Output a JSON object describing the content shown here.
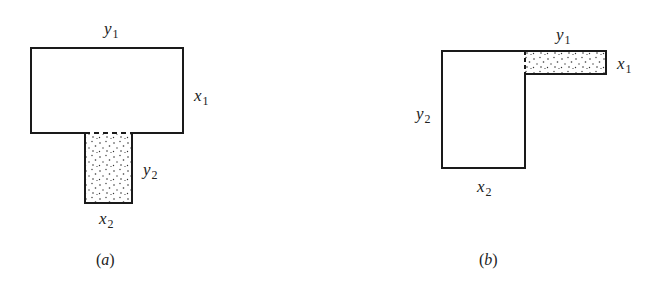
{
  "figure": {
    "panels": [
      {
        "id": "a",
        "caption_open": "(",
        "caption_letter": "a",
        "caption_close": ")",
        "shape": "T-section",
        "labels": {
          "y1": {
            "var": "y",
            "sub": "1"
          },
          "x1": {
            "var": "x",
            "sub": "1"
          },
          "y2": {
            "var": "y",
            "sub": "2"
          },
          "x2": {
            "var": "x",
            "sub": "2"
          }
        },
        "shaded_region": "stem"
      },
      {
        "id": "b",
        "caption_open": "(",
        "caption_letter": "b",
        "caption_close": ")",
        "shape": "L-section",
        "labels": {
          "y1": {
            "var": "y",
            "sub": "1"
          },
          "x1": {
            "var": "x",
            "sub": "1"
          },
          "y2": {
            "var": "y",
            "sub": "2"
          },
          "x2": {
            "var": "x",
            "sub": "2"
          }
        },
        "shaded_region": "top-right flange"
      }
    ],
    "colors": {
      "stroke": "#1a1a1a",
      "background": "#ffffff",
      "stipple": "#333333"
    }
  }
}
